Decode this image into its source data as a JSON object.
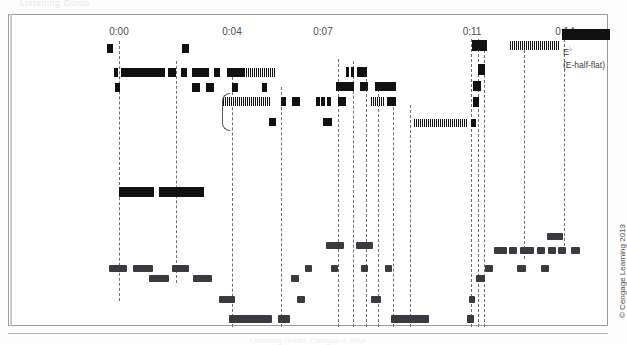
{
  "figure": {
    "ghost_top_text": "Listening Guide",
    "copyright": "© Cengage Learning 2013",
    "caption": "Listening Guide: Dastgah-e Shur"
  },
  "timeline": {
    "ticks": [
      {
        "label": "0:00",
        "x": 118
      },
      {
        "label": "0:04",
        "x": 231
      },
      {
        "label": "0:07",
        "x": 322
      },
      {
        "label": "0:11",
        "x": 471
      },
      {
        "label": "0:14",
        "x": 564
      }
    ]
  },
  "labels": {
    "performer": "Performance by\nHussein Ali Zodeh",
    "tonic": "Tonic (ist)",
    "tetrachord": "Exploration\nof lower\ntetrachord",
    "dotted_note": "Dotted lines show how\nthe notes of Zodeh's\nimprovisation correspond\nto Ma'aroufi's version of\nthis gusheh.",
    "notation_source": "Notation adapted\nfrom the radif of\nMoussa Ma'aroufi",
    "pitch_symbol": "E",
    "pitch_superscript": "♭",
    "pitch_name": "(E-half-flat)"
  },
  "chart_data": {
    "type": "table",
    "xlabel": "Time (minutes:seconds)",
    "ylabel": "Pitch register",
    "xlim": [
      0,
      600
    ],
    "grid": false,
    "legend": "none",
    "dotted_lines_x": [
      118,
      175,
      231,
      280,
      337,
      352,
      365,
      377,
      392,
      409,
      470,
      477,
      483,
      523,
      563
    ],
    "series": [
      {
        "name": "performance-upper",
        "note": "Hussein Ali Zodeh performance, upper register events",
        "bars": [
          {
            "x": 106,
            "y": 43,
            "w": 6,
            "h": 9,
            "style": "solid"
          },
          {
            "x": 181,
            "y": 43,
            "w": 7,
            "h": 9,
            "style": "solid"
          },
          {
            "x": 471,
            "y": 39,
            "w": 15,
            "h": 11,
            "style": "solid"
          },
          {
            "x": 509,
            "y": 40,
            "w": 50,
            "h": 9,
            "style": "hatch"
          },
          {
            "x": 561,
            "y": 28,
            "w": 48,
            "h": 11,
            "style": "solid"
          },
          {
            "x": 113,
            "y": 67,
            "w": 4,
            "h": 9,
            "style": "solid"
          },
          {
            "x": 120,
            "y": 67,
            "w": 44,
            "h": 9,
            "style": "solid"
          },
          {
            "x": 167,
            "y": 67,
            "w": 8,
            "h": 9,
            "style": "solid"
          },
          {
            "x": 180,
            "y": 67,
            "w": 6,
            "h": 9,
            "style": "solid"
          },
          {
            "x": 191,
            "y": 67,
            "w": 17,
            "h": 9,
            "style": "solid"
          },
          {
            "x": 213,
            "y": 67,
            "w": 6,
            "h": 9,
            "style": "solid"
          },
          {
            "x": 226,
            "y": 67,
            "w": 18,
            "h": 9,
            "style": "solid"
          },
          {
            "x": 245,
            "y": 67,
            "w": 30,
            "h": 9,
            "style": "hatch"
          },
          {
            "x": 345,
            "y": 66,
            "w": 3,
            "h": 10,
            "style": "solid"
          },
          {
            "x": 350,
            "y": 66,
            "w": 3,
            "h": 10,
            "style": "solid"
          },
          {
            "x": 356,
            "y": 66,
            "w": 10,
            "h": 10,
            "style": "solid"
          },
          {
            "x": 477,
            "y": 63,
            "w": 7,
            "h": 11,
            "style": "solid"
          },
          {
            "x": 114,
            "y": 82,
            "w": 5,
            "h": 9,
            "style": "solid"
          },
          {
            "x": 191,
            "y": 82,
            "w": 8,
            "h": 9,
            "style": "solid"
          },
          {
            "x": 205,
            "y": 82,
            "w": 8,
            "h": 9,
            "style": "solid"
          },
          {
            "x": 231,
            "y": 82,
            "w": 6,
            "h": 9,
            "style": "solid"
          },
          {
            "x": 261,
            "y": 82,
            "w": 5,
            "h": 9,
            "style": "solid"
          },
          {
            "x": 335,
            "y": 81,
            "w": 18,
            "h": 9,
            "style": "solid"
          },
          {
            "x": 359,
            "y": 81,
            "w": 8,
            "h": 9,
            "style": "solid"
          },
          {
            "x": 374,
            "y": 81,
            "w": 21,
            "h": 9,
            "style": "solid"
          },
          {
            "x": 472,
            "y": 80,
            "w": 8,
            "h": 10,
            "style": "solid"
          }
        ]
      },
      {
        "name": "performance-lower-tetrachord",
        "note": "Exploration of lower tetrachord region",
        "bars": [
          {
            "x": 222,
            "y": 96,
            "w": 48,
            "h": 9,
            "style": "hatch"
          },
          {
            "x": 280,
            "y": 96,
            "w": 5,
            "h": 9,
            "style": "solid"
          },
          {
            "x": 291,
            "y": 96,
            "w": 8,
            "h": 9,
            "style": "solid"
          },
          {
            "x": 315,
            "y": 96,
            "w": 4,
            "h": 9,
            "style": "solid"
          },
          {
            "x": 320,
            "y": 96,
            "w": 4,
            "h": 9,
            "style": "solid"
          },
          {
            "x": 326,
            "y": 96,
            "w": 4,
            "h": 9,
            "style": "solid"
          },
          {
            "x": 337,
            "y": 96,
            "w": 8,
            "h": 9,
            "style": "solid"
          },
          {
            "x": 370,
            "y": 96,
            "w": 13,
            "h": 9,
            "style": "hatch"
          },
          {
            "x": 386,
            "y": 96,
            "w": 9,
            "h": 9,
            "style": "solid"
          },
          {
            "x": 472,
            "y": 96,
            "w": 6,
            "h": 10,
            "style": "solid"
          },
          {
            "x": 268,
            "y": 117,
            "w": 7,
            "h": 8,
            "style": "solid"
          },
          {
            "x": 322,
            "y": 117,
            "w": 9,
            "h": 8,
            "style": "solid"
          },
          {
            "x": 413,
            "y": 118,
            "w": 54,
            "h": 8,
            "style": "hatch"
          },
          {
            "x": 470,
            "y": 118,
            "w": 5,
            "h": 8,
            "style": "solid"
          }
        ]
      },
      {
        "name": "performance-sustained",
        "note": "long held tones / correspondence band",
        "bars": [
          {
            "x": 118,
            "y": 186,
            "w": 35,
            "h": 10,
            "style": "solid"
          },
          {
            "x": 158,
            "y": 186,
            "w": 45,
            "h": 10,
            "style": "solid"
          }
        ]
      },
      {
        "name": "notation-maaroufi",
        "note": "Notation adapted from the radif of Moussa Ma'aroufi",
        "bars": [
          {
            "x": 546,
            "y": 232,
            "w": 16,
            "h": 7
          },
          {
            "x": 325,
            "y": 241,
            "w": 18,
            "h": 7
          },
          {
            "x": 355,
            "y": 241,
            "w": 17,
            "h": 7
          },
          {
            "x": 493,
            "y": 246,
            "w": 13,
            "h": 7
          },
          {
            "x": 508,
            "y": 246,
            "w": 8,
            "h": 7
          },
          {
            "x": 519,
            "y": 246,
            "w": 14,
            "h": 7
          },
          {
            "x": 536,
            "y": 246,
            "w": 8,
            "h": 7
          },
          {
            "x": 547,
            "y": 246,
            "w": 8,
            "h": 7
          },
          {
            "x": 557,
            "y": 246,
            "w": 8,
            "h": 7
          },
          {
            "x": 570,
            "y": 246,
            "w": 9,
            "h": 7
          },
          {
            "x": 108,
            "y": 264,
            "w": 18,
            "h": 7
          },
          {
            "x": 132,
            "y": 264,
            "w": 20,
            "h": 7
          },
          {
            "x": 171,
            "y": 264,
            "w": 17,
            "h": 7
          },
          {
            "x": 304,
            "y": 264,
            "w": 7,
            "h": 7
          },
          {
            "x": 330,
            "y": 264,
            "w": 7,
            "h": 7
          },
          {
            "x": 360,
            "y": 264,
            "w": 7,
            "h": 7
          },
          {
            "x": 384,
            "y": 264,
            "w": 7,
            "h": 7
          },
          {
            "x": 484,
            "y": 264,
            "w": 8,
            "h": 7
          },
          {
            "x": 516,
            "y": 264,
            "w": 9,
            "h": 7
          },
          {
            "x": 540,
            "y": 264,
            "w": 8,
            "h": 7
          },
          {
            "x": 148,
            "y": 274,
            "w": 20,
            "h": 7
          },
          {
            "x": 192,
            "y": 274,
            "w": 19,
            "h": 7
          },
          {
            "x": 290,
            "y": 274,
            "w": 8,
            "h": 7
          },
          {
            "x": 475,
            "y": 274,
            "w": 9,
            "h": 7
          },
          {
            "x": 218,
            "y": 295,
            "w": 16,
            "h": 7
          },
          {
            "x": 296,
            "y": 295,
            "w": 8,
            "h": 7
          },
          {
            "x": 370,
            "y": 295,
            "w": 10,
            "h": 7
          },
          {
            "x": 468,
            "y": 295,
            "w": 6,
            "h": 7
          },
          {
            "x": 228,
            "y": 314,
            "w": 43,
            "h": 8
          },
          {
            "x": 277,
            "y": 314,
            "w": 12,
            "h": 8
          },
          {
            "x": 390,
            "y": 314,
            "w": 38,
            "h": 8
          },
          {
            "x": 466,
            "y": 314,
            "w": 7,
            "h": 8
          }
        ]
      }
    ]
  }
}
